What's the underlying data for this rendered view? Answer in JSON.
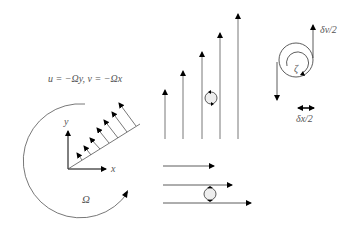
{
  "diagram": {
    "formula": "u = −Ωy, v = −Ωx",
    "axis_x": "x",
    "axis_y": "y",
    "omega": "Ω",
    "zeta": "ζ",
    "dv_label": "δv/2",
    "dx_label": "δx/2",
    "colors": {
      "line": "#333333",
      "arrow": "#000000",
      "text": "#555555"
    }
  }
}
